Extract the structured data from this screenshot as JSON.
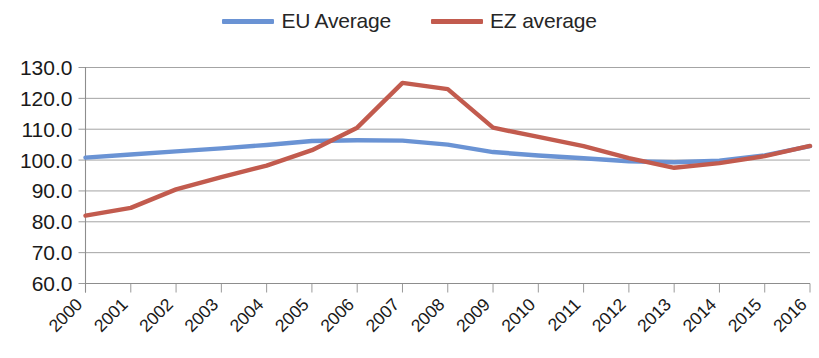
{
  "chart_data": {
    "type": "line",
    "title": "",
    "subtitle": "",
    "xlabel": "",
    "ylabel": "",
    "grid": true,
    "legend_position": "top-center",
    "ylim": [
      60.0,
      130.0
    ],
    "ytick_step": 10.0,
    "ytick_labels": [
      "130.0",
      "120.0",
      "110.0",
      "100.0",
      "90.0",
      "80.0",
      "70.0",
      "60.0"
    ],
    "ytick_values": [
      130.0,
      120.0,
      110.0,
      100.0,
      90.0,
      80.0,
      70.0,
      60.0
    ],
    "categories": [
      "2000",
      "2001",
      "2002",
      "2003",
      "2004",
      "2005",
      "2006",
      "2007",
      "2008",
      "2009",
      "2010",
      "2011",
      "2012",
      "2013",
      "2014",
      "2015",
      "2016"
    ],
    "x": [
      2000,
      2001,
      2002,
      2003,
      2004,
      2005,
      2006,
      2007,
      2008,
      2009,
      2010,
      2011,
      2012,
      2013,
      2014,
      2015,
      2016
    ],
    "series": [
      {
        "name": "EU Average",
        "color": "#6A93D4",
        "values": [
          100.8,
          101.8,
          102.8,
          103.8,
          104.9,
          106.2,
          106.4,
          106.3,
          105.0,
          102.6,
          101.5,
          100.6,
          99.6,
          99.3,
          99.8,
          101.5,
          104.5
        ]
      },
      {
        "name": "EZ average",
        "color": "#C25B4E",
        "values": [
          82.0,
          84.5,
          90.5,
          94.5,
          98.2,
          103.2,
          110.5,
          125.0,
          123.0,
          110.5,
          107.5,
          104.5,
          100.6,
          97.5,
          99.0,
          101.3,
          104.6
        ]
      }
    ]
  },
  "legend": {
    "items": [
      {
        "label": "EU Average",
        "color": "#6A93D4",
        "swatch_name": "legend-swatch-eu-average"
      },
      {
        "label": "EZ average",
        "color": "#C25B4E",
        "swatch_name": "legend-swatch-ez-average"
      }
    ]
  },
  "axes": {
    "y": {
      "labels": [
        "130.0",
        "120.0",
        "110.0",
        "100.0",
        "90.0",
        "80.0",
        "70.0",
        "60.0"
      ]
    },
    "x": {
      "labels": [
        "2000",
        "2001",
        "2002",
        "2003",
        "2004",
        "2005",
        "2006",
        "2007",
        "2008",
        "2009",
        "2010",
        "2011",
        "2012",
        "2013",
        "2014",
        "2015",
        "2016"
      ],
      "rotation": "-45"
    }
  },
  "colors": {
    "series_blue": "#6A93D4",
    "series_red": "#C25B4E",
    "gridline": "#9A9A9A",
    "axis": "#8D8D8D",
    "text": "#1A1A1A",
    "background": "#FFFFFF"
  }
}
